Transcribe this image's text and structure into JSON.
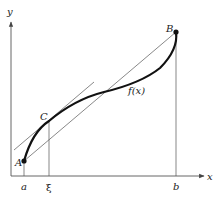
{
  "diagram": {
    "axes": {
      "x_label": "x",
      "y_label": "y"
    },
    "points": {
      "A": "A",
      "B": "B",
      "C": "C"
    },
    "curve_label": "f(x)",
    "ticks": {
      "a": "a",
      "xi": "ξ",
      "b": "b"
    },
    "colors": {
      "axis": "#555555",
      "curve": "#111111",
      "thin_line": "#555555"
    }
  }
}
